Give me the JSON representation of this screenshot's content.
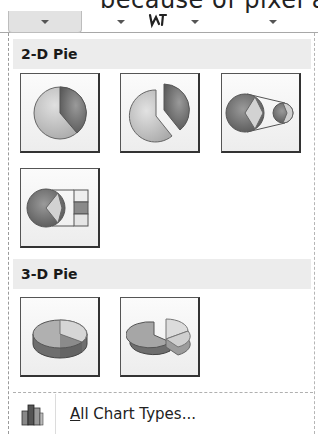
{
  "background_text": "because of pixel a",
  "toolbar": {
    "buttons": [
      {
        "name": "pie-dropdown",
        "active": true
      },
      {
        "name": "dropdown-2",
        "active": false
      },
      {
        "name": "sparkline-dropdown",
        "active": false
      },
      {
        "name": "dropdown-4",
        "active": false
      }
    ],
    "glyph": "sparkline"
  },
  "gallery": {
    "sections": [
      {
        "title": "2-D Pie",
        "items": [
          {
            "label": "Pie",
            "icon": "pie-icon"
          },
          {
            "label": "Exploded Pie",
            "icon": "exploded-pie-icon"
          },
          {
            "label": "Pie of Pie",
            "icon": "pie-of-pie-icon"
          },
          {
            "label": "Bar of Pie",
            "icon": "bar-of-pie-icon"
          }
        ]
      },
      {
        "title": "3-D Pie",
        "items": [
          {
            "label": "Pie in 3-D",
            "icon": "pie-3d-icon"
          },
          {
            "label": "Exploded Pie in 3-D",
            "icon": "exploded-pie-3d-icon"
          }
        ]
      }
    ],
    "footer": {
      "label_accel": "A",
      "label_rest": "ll Chart Types...",
      "icon": "chart-types-icon"
    }
  },
  "colors": {
    "header_bg": "#ececec",
    "slice_light": "#c8c8c8",
    "slice_dark": "#7a7a7a",
    "button_border": "#333333"
  }
}
